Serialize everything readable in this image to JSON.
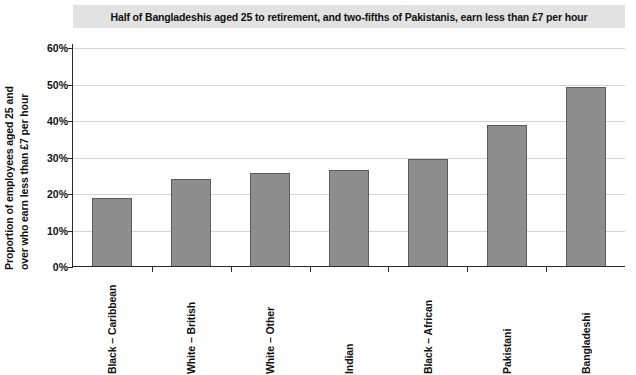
{
  "chart_data": {
    "type": "bar",
    "title": "Half of Bangladeshis aged 25 to retirement, and two-fifths of Pakistanis, earn less than £7 per hour",
    "xlabel": "",
    "ylabel_line1": "Proportion of employees aged 25 and",
    "ylabel_line2": "over who earn less than £7 per hour",
    "categories": [
      "Black – Caribbean",
      "White – British",
      "White – Other",
      "Indian",
      "Black – African",
      "Pakistani",
      "Bangladeshi"
    ],
    "values": [
      19,
      24,
      25.8,
      26.7,
      29.5,
      39,
      49.3
    ],
    "value_labels": [
      "19%",
      "24%",
      "25.8%",
      "26.7%",
      "29.5%",
      "39%",
      "49.3%"
    ],
    "ylim": [
      0,
      60
    ],
    "ytick_values": [
      0,
      10,
      20,
      30,
      40,
      50,
      60
    ],
    "ytick_labels": [
      "0%",
      "10%",
      "20%",
      "30%",
      "40%",
      "50%",
      "60%"
    ],
    "grid": true,
    "legend": "none",
    "bar_color": "#8e8e8e",
    "bar_edge_color": "#5b5b5b",
    "grid_color": "#d4d4d4",
    "axis_color": "#2a2a2a",
    "title_band_color": "#e2e2e2"
  }
}
